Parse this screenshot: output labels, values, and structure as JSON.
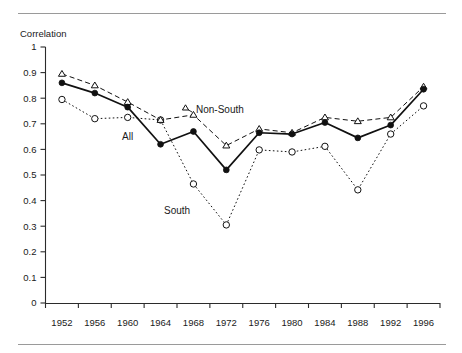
{
  "chart_data": {
    "type": "line",
    "title": "",
    "xlabel": "",
    "ylabel": "Correlation",
    "ylim": [
      0,
      1
    ],
    "ytick_labels": [
      "1",
      "0.9",
      "0.8",
      "0.7",
      "0.6",
      "0.5",
      "0.4",
      "0.3",
      "0.2",
      "0.1",
      "0"
    ],
    "ytick_values": [
      1,
      0.9,
      0.8,
      0.7,
      0.6,
      0.5,
      0.4,
      0.3,
      0.2,
      0.1,
      0
    ],
    "grid": false,
    "legend_position": "inline-annotations",
    "categories": [
      "1952",
      "1956",
      "1960",
      "1964",
      "1968",
      "1972",
      "1976",
      "1980",
      "1984",
      "1988",
      "1992",
      "1996"
    ],
    "x": [
      1952,
      1956,
      1960,
      1964,
      1968,
      1972,
      1976,
      1980,
      1984,
      1988,
      1992,
      1996
    ],
    "series": [
      {
        "name": "All",
        "marker": "filled-circle",
        "linestyle": "solid",
        "values": [
          0.86,
          0.82,
          0.765,
          0.62,
          0.67,
          0.52,
          0.665,
          0.66,
          0.705,
          0.645,
          0.695,
          0.835
        ]
      },
      {
        "name": "Non-South",
        "marker": "open-triangle",
        "linestyle": "dashed",
        "values": [
          0.895,
          0.85,
          0.785,
          0.715,
          0.735,
          0.615,
          0.68,
          0.665,
          0.725,
          0.71,
          0.725,
          0.845
        ]
      },
      {
        "name": "South",
        "marker": "open-circle",
        "linestyle": "dotted",
        "values": [
          0.795,
          0.72,
          0.725,
          0.715,
          0.465,
          0.305,
          0.598,
          0.59,
          0.612,
          0.442,
          0.66,
          0.77
        ]
      }
    ],
    "annotations": [
      {
        "text": "All",
        "series": "All"
      },
      {
        "text": "Non-South",
        "series": "Non-South"
      },
      {
        "text": "South",
        "series": "South"
      }
    ]
  }
}
